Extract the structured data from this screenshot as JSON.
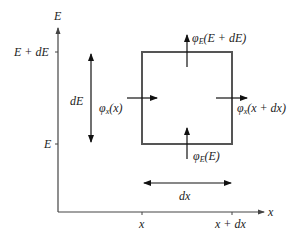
{
  "diagram": {
    "axes": {
      "y_label": "E",
      "x_label": "x",
      "y_ticks": [
        {
          "label": "E + dE",
          "y": 52
        },
        {
          "label": "E",
          "y": 144
        }
      ],
      "x_ticks": [
        {
          "label": "x",
          "x": 142
        },
        {
          "label": "x + dx",
          "x": 232
        }
      ]
    },
    "box": {
      "left": 142,
      "top": 52,
      "right": 232,
      "bottom": 144
    },
    "flux_labels": {
      "phi_x_x": {
        "sym": "φ",
        "sub": "x",
        "arg": "(x)"
      },
      "phi_x_xdx": {
        "sym": "φ",
        "sub": "x",
        "arg": "(x + dx)"
      },
      "phi_E_E": {
        "sym": "φ",
        "sub": "E",
        "arg": "(E)"
      },
      "phi_E_EdE": {
        "sym": "φ",
        "sub": "E",
        "arg": "(E + dE)"
      }
    },
    "dimension_labels": {
      "dE": "dE",
      "dx": "dx"
    },
    "colors": {
      "box_stroke": "#555555",
      "axis_stroke": "#444444",
      "arrow": "#111111"
    }
  }
}
